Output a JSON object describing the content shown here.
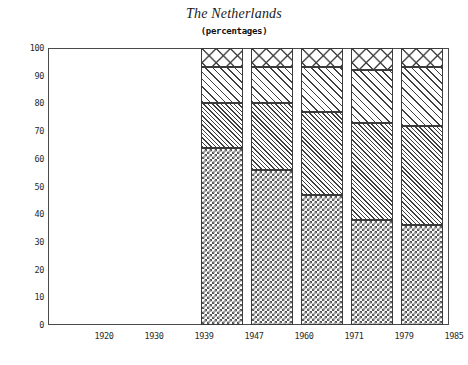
{
  "chart_data": {
    "type": "bar",
    "subtype": "stacked-bar-100",
    "title": "The Netherlands",
    "subtitle": "(percentages)",
    "xlabel": "",
    "ylabel": "",
    "ylim": [
      0,
      100
    ],
    "yticks": [
      0,
      10,
      20,
      30,
      40,
      50,
      60,
      70,
      80,
      90,
      100
    ],
    "ytick_labels": [
      "0",
      "10",
      "20",
      "30",
      "40",
      "50",
      "60",
      "70",
      "80",
      "90",
      "100"
    ],
    "categories": [
      "1920",
      "1930",
      "1939",
      "1947",
      "1960",
      "1971",
      "1979",
      "1985"
    ],
    "grid": false,
    "legend": "none",
    "series": [
      {
        "name": "segment-1-bottom",
        "pattern": "fine-checkerboard",
        "values": [
          null,
          null,
          null,
          64,
          56,
          47,
          38,
          36
        ]
      },
      {
        "name": "segment-2",
        "pattern": "fine-diagonal-hatch",
        "values": [
          null,
          null,
          null,
          16,
          24,
          30,
          35,
          36
        ]
      },
      {
        "name": "segment-3",
        "pattern": "coarse-diagonal-hatch",
        "values": [
          null,
          null,
          null,
          13,
          13,
          16,
          19,
          21
        ]
      },
      {
        "name": "segment-4-top",
        "pattern": "cross-hatch-lattice",
        "values": [
          null,
          null,
          null,
          7,
          7,
          7,
          8,
          7
        ]
      }
    ],
    "cumulative_boundaries": {
      "1947": [
        64,
        80,
        93,
        100
      ],
      "1960": [
        56,
        80,
        93,
        100
      ],
      "1971": [
        47,
        77,
        93,
        100
      ],
      "1979": [
        38,
        73,
        92,
        100
      ],
      "1985": [
        36,
        72,
        93,
        100
      ]
    },
    "note": "Bars shown only for years 1947, 1960, 1971, 1979 and 1985; 1920, 1930 and 1939 have axis labels but no data bars."
  },
  "axes": {
    "y_ticks": [
      {
        "label": "100",
        "value": 100
      },
      {
        "label": "90",
        "value": 90
      },
      {
        "label": "80",
        "value": 80
      },
      {
        "label": "70",
        "value": 70
      },
      {
        "label": "60",
        "value": 60
      },
      {
        "label": "50",
        "value": 50
      },
      {
        "label": "40",
        "value": 40
      },
      {
        "label": "30",
        "value": 30
      },
      {
        "label": "20",
        "value": 20
      },
      {
        "label": "10",
        "value": 10
      },
      {
        "label": "0",
        "value": 0
      }
    ],
    "x_ticks": [
      {
        "label": "1920",
        "center": 104
      },
      {
        "label": "1930",
        "center": 154
      },
      {
        "label": "1939",
        "center": 204
      },
      {
        "label": "1947",
        "center": 254
      },
      {
        "label": "1960",
        "center": 304
      },
      {
        "label": "1971",
        "center": 354
      },
      {
        "label": "1979",
        "center": 404
      },
      {
        "label": "1985",
        "center": 454
      }
    ]
  },
  "bars": [
    {
      "category": "1947",
      "x": 153,
      "width": 42,
      "segments": [
        {
          "name": "segment-4-top",
          "pattern": "cross",
          "from": 93,
          "to": 100
        },
        {
          "name": "segment-3",
          "pattern": "diag-coarse",
          "from": 80,
          "to": 93
        },
        {
          "name": "segment-2",
          "pattern": "diag-fine",
          "from": 64,
          "to": 80
        },
        {
          "name": "segment-1-bottom",
          "pattern": "checker",
          "from": 0,
          "to": 64
        }
      ]
    },
    {
      "category": "1960",
      "x": 203,
      "width": 42,
      "segments": [
        {
          "name": "segment-4-top",
          "pattern": "cross",
          "from": 93,
          "to": 100
        },
        {
          "name": "segment-3",
          "pattern": "diag-coarse",
          "from": 80,
          "to": 93
        },
        {
          "name": "segment-2",
          "pattern": "diag-fine",
          "from": 56,
          "to": 80
        },
        {
          "name": "segment-1-bottom",
          "pattern": "checker",
          "from": 0,
          "to": 56
        }
      ]
    },
    {
      "category": "1971",
      "x": 253,
      "width": 42,
      "segments": [
        {
          "name": "segment-4-top",
          "pattern": "cross",
          "from": 93,
          "to": 100
        },
        {
          "name": "segment-3",
          "pattern": "diag-coarse",
          "from": 77,
          "to": 93
        },
        {
          "name": "segment-2",
          "pattern": "diag-fine",
          "from": 47,
          "to": 77
        },
        {
          "name": "segment-1-bottom",
          "pattern": "checker",
          "from": 0,
          "to": 47
        }
      ]
    },
    {
      "category": "1979",
      "x": 303,
      "width": 42,
      "segments": [
        {
          "name": "segment-4-top",
          "pattern": "cross",
          "from": 92,
          "to": 100
        },
        {
          "name": "segment-3",
          "pattern": "diag-coarse",
          "from": 73,
          "to": 92
        },
        {
          "name": "segment-2",
          "pattern": "diag-fine",
          "from": 38,
          "to": 73
        },
        {
          "name": "segment-1-bottom",
          "pattern": "checker",
          "from": 0,
          "to": 38
        }
      ]
    },
    {
      "category": "1985",
      "x": 353,
      "width": 42,
      "segments": [
        {
          "name": "segment-4-top",
          "pattern": "cross",
          "from": 93,
          "to": 100
        },
        {
          "name": "segment-3",
          "pattern": "diag-coarse",
          "from": 72,
          "to": 93
        },
        {
          "name": "segment-2",
          "pattern": "diag-fine",
          "from": 36,
          "to": 72
        },
        {
          "name": "segment-1-bottom",
          "pattern": "checker",
          "from": 0,
          "to": 36
        }
      ]
    }
  ],
  "colors": {
    "background": "#ffffff",
    "axis": "#4a4a4a",
    "text": "#1a1a1a",
    "hatch": "#3f3f3f"
  }
}
